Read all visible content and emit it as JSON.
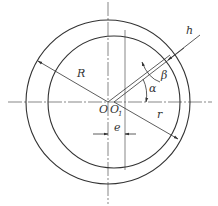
{
  "diagram": {
    "type": "eccentric-circles-geometry",
    "labels": {
      "R": "R",
      "r": "r",
      "h": "h",
      "alpha": "α",
      "beta": "β",
      "O": "O",
      "O1": "O",
      "O1_sub": "1",
      "e": "e"
    },
    "outer_circle": {
      "center": "O",
      "radius_label": "R"
    },
    "inner_circle": {
      "center": "O1",
      "radius_label": "r"
    },
    "eccentricity_label": "e",
    "colors": {
      "line": "#333333",
      "background": "#ffffff"
    }
  }
}
